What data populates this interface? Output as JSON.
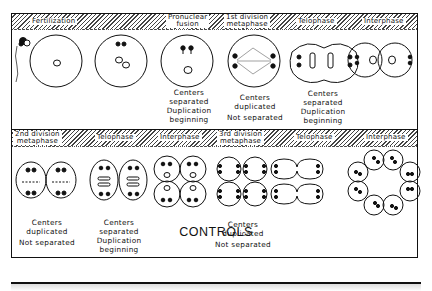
{
  "figure": {
    "title": "CONTROLS",
    "rows": [
      {
        "stages": [
          {
            "label": "Fertilization"
          },
          {
            "label_line1": "Pronuclear",
            "label_line2": "fusion"
          },
          {
            "label_line1": "1st division",
            "label_line2": "metaphase"
          },
          {
            "label": "Telophase"
          },
          {
            "label": "Interphase"
          }
        ],
        "captions": [
          {
            "lines": [
              "Centers",
              "separated",
              "Duplication",
              "beginning"
            ]
          },
          {
            "lines": [
              "Centers",
              "duplicated",
              "Not separated"
            ]
          },
          {
            "lines": [
              "Centers",
              "separated",
              "Duplication",
              "beginning"
            ]
          }
        ]
      },
      {
        "stages": [
          {
            "label_line1": "2nd division",
            "label_line2": "metaphase"
          },
          {
            "label": "Telophase"
          },
          {
            "label": "Interphase"
          },
          {
            "label_line1": "3rd division",
            "label_line2": "metaphase"
          },
          {
            "label": "Telophase"
          },
          {
            "label": "Interphase"
          }
        ],
        "captions": [
          {
            "lines": [
              "Centers",
              "duplicated",
              "Not separated"
            ]
          },
          {
            "lines": [
              "Centers",
              "separated",
              "Duplication",
              "beginning"
            ]
          },
          {
            "lines": [
              "Centers",
              "duplicated",
              "Not separated"
            ]
          }
        ]
      }
    ]
  }
}
